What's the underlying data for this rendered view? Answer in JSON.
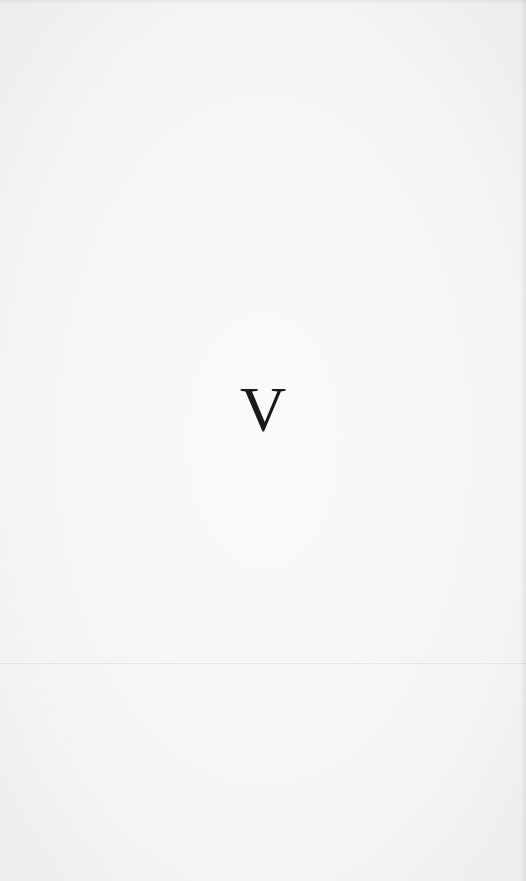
{
  "page": {
    "section_letter": "V"
  }
}
